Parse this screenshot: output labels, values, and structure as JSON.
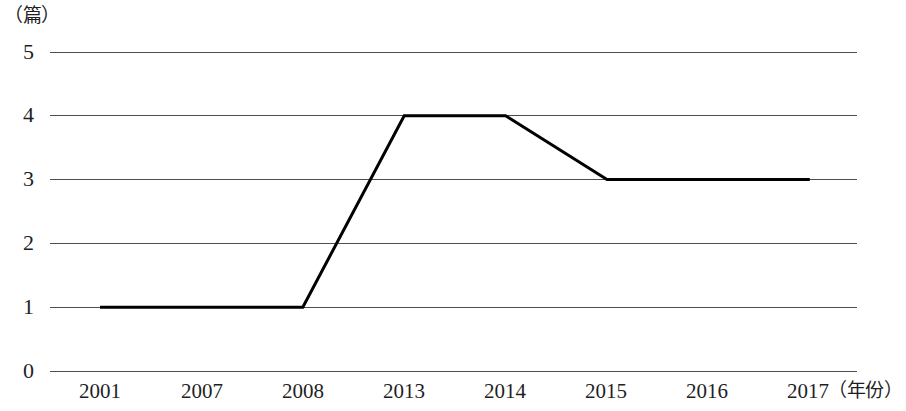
{
  "chart_data": {
    "type": "line",
    "title": "",
    "subtitle": "",
    "xlabel": "（年份）",
    "ylabel": "（篇）",
    "categories": [
      "2001",
      "2007",
      "2008",
      "2013",
      "2014",
      "2015",
      "2016",
      "2017"
    ],
    "series": [
      {
        "name": "",
        "values": [
          1,
          1,
          1,
          4,
          4,
          3,
          3,
          3
        ]
      }
    ],
    "ylim": [
      0,
      5
    ],
    "yticks": [
      5,
      4,
      3,
      2,
      1,
      0
    ],
    "ytick_labels": [
      "5",
      "4",
      "3",
      "2",
      "1",
      "0"
    ],
    "grid": true,
    "grid_axis": "y",
    "legend": "none",
    "colors": {
      "series_line": "#000000",
      "gridline": "#4d4d4d",
      "text": "#1f1f1f",
      "background": "#ffffff"
    },
    "line_width_px": 3
  },
  "axes": {
    "y_unit_label": "（篇）",
    "x_unit_label": "（年份）"
  }
}
